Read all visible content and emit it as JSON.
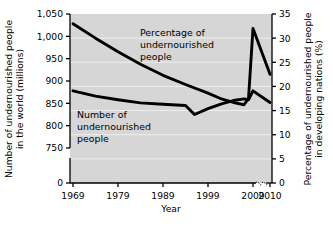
{
  "chart_data": {
    "type": "line",
    "title": "",
    "xlabel": "Year",
    "ylabel": "Number of undernourished people in the world (millions)",
    "ylabel_line1": "Number of undernourished people",
    "ylabel_line2": "in the world (millions)",
    "y2label": "Percentage of undernourished people in developing nations (%)",
    "y2label_line1": "Percentage of undernourished people",
    "y2label_line2": "in developing nations (%)",
    "grid": true,
    "legend_position": "inline-annotations",
    "xticks": [
      "1969",
      "1979",
      "1989",
      "1999",
      "2009",
      "2010"
    ],
    "xtick_values": [
      1969,
      1979,
      1989,
      1999,
      2009,
      2010
    ],
    "xlim": [
      1967,
      2010
    ],
    "x_axis_break": true,
    "x_axis_break_between": [
      "2009",
      "2010"
    ],
    "yticks": [
      "0",
      "750",
      "800",
      "850",
      "900",
      "950",
      "1,000",
      "1,050"
    ],
    "ytick_values": [
      0,
      750,
      800,
      850,
      900,
      950,
      1000,
      1050
    ],
    "ylim": [
      750,
      1050
    ],
    "y_axis_break": true,
    "y2ticks": [
      "0",
      "5",
      "10",
      "15",
      "20",
      "25",
      "30",
      "35"
    ],
    "y2tick_values": [
      0,
      5,
      10,
      15,
      20,
      25,
      30,
      35
    ],
    "y2lim": [
      0,
      35
    ],
    "plot_background": "#d6d6d6",
    "line_color": "#000000",
    "series": [
      {
        "name": "Percentage of undernourished people",
        "axis": "right",
        "units": "%",
        "annotation_lines": [
          "Percentage of",
          "undernourished",
          "people"
        ],
        "x": [
          1969,
          1974,
          1979,
          1984,
          1989,
          1994,
          1999,
          2002,
          2005,
          2007,
          2008,
          2009,
          2010
        ],
        "values": [
          33.0,
          30.0,
          27.2,
          24.6,
          22.3,
          20.4,
          18.6,
          17.4,
          16.6,
          16.2,
          17.5,
          32.0,
          22.5
        ]
      },
      {
        "name": "Number of undernourished people",
        "axis": "left",
        "units": "millions",
        "annotation_lines": [
          "Number of",
          "undernourished",
          "people"
        ],
        "x": [
          1969,
          1974,
          1979,
          1984,
          1989,
          1994,
          1996,
          1999,
          2002,
          2005,
          2007,
          2008,
          2009,
          2010
        ],
        "values": [
          878,
          866,
          858,
          851,
          848,
          845,
          825,
          838,
          849,
          857,
          860,
          858,
          878,
          852
        ]
      }
    ]
  }
}
